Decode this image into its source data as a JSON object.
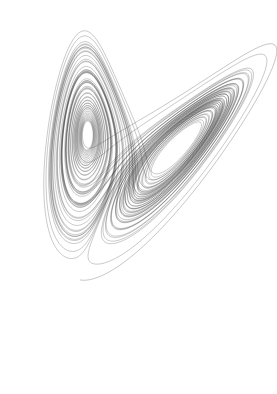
{
  "figure": {
    "kind": "strange-attractor-phase-portrait",
    "width": 277,
    "height": 394,
    "background_color": "#ffffff",
    "line_color": "#1a1a1a",
    "transient_line_color": "#3a3a3a",
    "line_width": 0.3,
    "line_opacity": 0.78,
    "has_axes": false,
    "has_gridlines": false,
    "has_legend": false,
    "has_tick_labels": false,
    "has_title_text": false
  },
  "chart_data": {
    "type": "line",
    "subtitle": "",
    "xlabel": "",
    "ylabel": "",
    "plot_plane": "x-z projection",
    "grid": false,
    "legend": false,
    "legend_position": "none",
    "xlim": [
      -20.5,
      20.5
    ],
    "ylim": [
      0.0,
      50.0
    ],
    "system": {
      "name": "Lorenz 1963",
      "equations": [
        "dx/dt = sigma * (y - x)",
        "dy/dt = x * (rho - z) - y",
        "dz/dt = x * y - beta * z"
      ],
      "parameters": {
        "sigma": 10.0,
        "rho": 28.0,
        "beta": 2.6666666667
      },
      "initial_conditions": {
        "x0": 0.9,
        "y0": 2.4,
        "z0": 1.2
      },
      "integration": {
        "method": "rk4",
        "dt": 0.0045,
        "steps": 17000,
        "transient_steps": 360
      }
    },
    "fixed_points": [
      {
        "name": "origin",
        "x": 0.0,
        "z": 0.0
      },
      {
        "name": "C+",
        "x": 8.485,
        "z": 27.0
      },
      {
        "name": "C-",
        "x": -8.485,
        "z": 27.0
      }
    ],
    "features": {
      "lobes": 2,
      "left_lobe_center_px": [
        95,
        188
      ],
      "right_lobe_center_px": [
        199,
        176
      ],
      "right_lobe_hole_px": [
        199,
        176
      ],
      "right_lobe_hole_size_px": [
        13,
        26
      ],
      "crossing_band_px": [
        140,
        200
      ],
      "left_apex_px": [
        48,
        22
      ],
      "right_apex_px": [
        250,
        60
      ],
      "tail_end_px": [
        140,
        372
      ]
    },
    "view_transform": {
      "rotation_deg": -8.0,
      "shear_x": 0.26,
      "scale_x": 5.35,
      "scale_y": 5.6,
      "offset_x_px": 128,
      "offset_y_px": 352
    }
  }
}
